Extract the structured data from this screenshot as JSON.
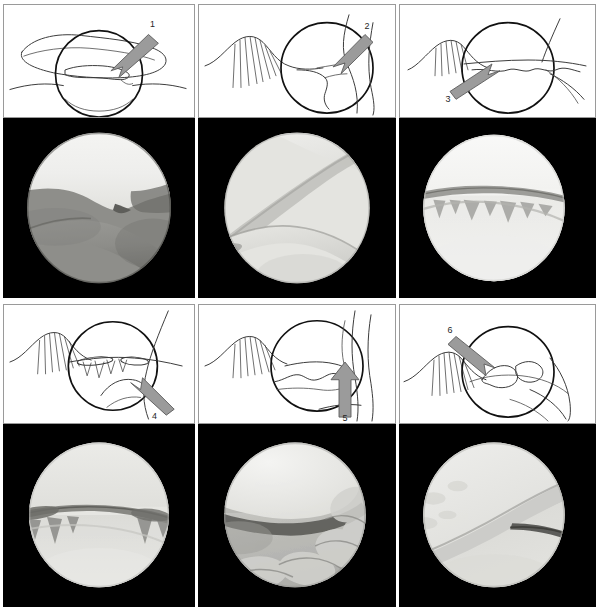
{
  "figure": {
    "layout": {
      "columns": 3,
      "rows": 2,
      "panel_count": 6
    },
    "background_color": "#ffffff",
    "photo_background_color": "#000000",
    "arrow_fill_color": "#9b9b9b",
    "line_color": "#3a3a3a"
  },
  "panels": [
    {
      "id": "panel-1",
      "callout": "1",
      "callout_position": "top-right",
      "arrow_direction": "down-left",
      "schematic_caption": "Line schematic with magnification circle and labeling arrow 1",
      "photo_caption": "Arthroscopic view 1: bright white cartilage surface above with a notch, darker soft-tissue band running diagonally below"
    },
    {
      "id": "panel-2",
      "callout": "2",
      "callout_position": "top-right",
      "arrow_direction": "down-left",
      "schematic_caption": "Line schematic with hatched region, magnification circle and labeling arrow 2",
      "photo_caption": "Arthroscopic view 2: uniformly pale gray surfaces meeting along a diagonal ridge"
    },
    {
      "id": "panel-3",
      "callout": "3",
      "callout_position": "bottom-left",
      "arrow_direction": "up-right",
      "schematic_caption": "Line schematic with hatched region, magnification circle and labeling arrow 3",
      "photo_caption": "Arthroscopic view 3: bright field with a dark irregular horizontal fringe across the middle"
    },
    {
      "id": "panel-4",
      "callout": "4",
      "callout_position": "bottom-right",
      "arrow_direction": "up-left",
      "schematic_caption": "Line schematic with hatched region, magnification circle and labeling arrow 4",
      "photo_caption": "Arthroscopic view 4: pale field crossed by a dark horizontal cleft with fringed projections"
    },
    {
      "id": "panel-5",
      "callout": "5",
      "callout_position": "bottom-right",
      "arrow_direction": "up",
      "schematic_caption": "Line schematic with hatched region, magnification circle and labeling arrow 5",
      "photo_caption": "Arthroscopic view 5: bright rounded cartilage lobe upper-left, dark crevice, lobulated gray tissue lower-right"
    },
    {
      "id": "panel-6",
      "callout": "6",
      "callout_position": "top-left",
      "arrow_direction": "down-right",
      "schematic_caption": "Line schematic with hatched region, magnification circle and labeling arrow 6",
      "photo_caption": "Arthroscopic view 6: pale surfaces meeting along a broad diagonal ridge with a dark linear fissure"
    }
  ]
}
